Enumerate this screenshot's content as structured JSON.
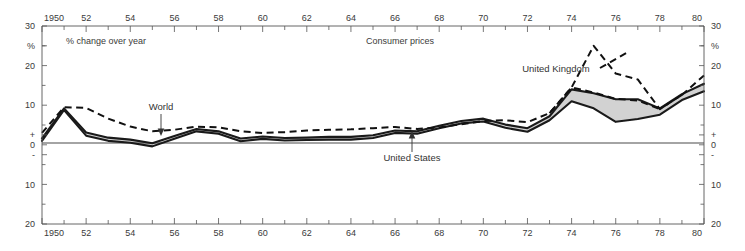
{
  "chart_data": {
    "type": "line",
    "title": "Consumer prices",
    "subtitle": "% change over year",
    "xlabel": "",
    "ylabel": "%",
    "xlim": [
      1950,
      1980
    ],
    "ylim": [
      -20,
      30
    ],
    "grid": false,
    "legend_position": "inline-annotations",
    "x_tick_labels": [
      "1950",
      "52",
      "54",
      "56",
      "58",
      "60",
      "62",
      "64",
      "66",
      "68",
      "70",
      "72",
      "74",
      "76",
      "78",
      "80"
    ],
    "x_tick_values": [
      1950,
      1952,
      1954,
      1956,
      1958,
      1960,
      1962,
      1964,
      1966,
      1968,
      1970,
      1972,
      1974,
      1976,
      1978,
      1980
    ],
    "x_minor_tick_values": [
      1951,
      1953,
      1955,
      1957,
      1959,
      1961,
      1963,
      1965,
      1967,
      1969,
      1971,
      1973,
      1975,
      1977,
      1979
    ],
    "y_tick_labels_left": [
      "30",
      "%",
      "20",
      "10",
      "+",
      "0",
      "-",
      "10",
      "20"
    ],
    "y_tick_labels_right": [
      "30",
      "%",
      "20",
      "10",
      "+",
      "0",
      "-",
      "10",
      "20"
    ],
    "y_tick_values": [
      30,
      25,
      20,
      10,
      2.5,
      0,
      -2.5,
      -10,
      -20
    ],
    "x": [
      1950,
      1951,
      1952,
      1953,
      1954,
      1955,
      1956,
      1957,
      1958,
      1959,
      1960,
      1961,
      1962,
      1963,
      1964,
      1965,
      1966,
      1967,
      1968,
      1969,
      1970,
      1971,
      1972,
      1973,
      1974,
      1975,
      1976,
      1977,
      1978,
      1979,
      1980
    ],
    "series": [
      {
        "name": "World",
        "style": "dashed",
        "annotation": "World",
        "annotation_x": 1954.2,
        "annotation_y": 9.6,
        "values": [
          3.0,
          9.5,
          9.3,
          6.6,
          4.6,
          3.4,
          3.8,
          4.6,
          4.4,
          3.4,
          3.0,
          3.2,
          3.6,
          3.8,
          3.9,
          4.2,
          4.5,
          4.0,
          4.4,
          5.2,
          6.0,
          6.2,
          5.7,
          8.0,
          14.5,
          13.2,
          11.6,
          11.2,
          9.0,
          12.6,
          17.5
        ]
      },
      {
        "name": "United Kingdom",
        "style": "dashed",
        "annotation": "United Kingdom",
        "annotation_x": 1971.4,
        "annotation_y": 20.0,
        "values": [
          3.0,
          9.5,
          9.3,
          6.6,
          4.6,
          3.4,
          3.8,
          4.6,
          4.4,
          3.4,
          3.0,
          3.2,
          3.6,
          3.8,
          3.9,
          4.2,
          4.5,
          4.0,
          4.4,
          5.2,
          6.0,
          6.2,
          5.7,
          8.0,
          14.5,
          25.0,
          18.0,
          16.5,
          9.0,
          12.6,
          17.5
        ]
      },
      {
        "name": "United States",
        "style": "solid",
        "annotation": "United States",
        "annotation_x": 1965.6,
        "annotation_y": -5.6,
        "values": [
          1.0,
          8.8,
          2.3,
          1.0,
          0.5,
          -0.4,
          1.5,
          3.4,
          2.8,
          0.9,
          1.5,
          1.1,
          1.2,
          1.3,
          1.3,
          1.7,
          3.0,
          2.8,
          4.2,
          5.4,
          5.9,
          4.3,
          3.3,
          6.2,
          11.0,
          9.2,
          5.8,
          6.5,
          7.6,
          11.3,
          13.5
        ]
      },
      {
        "name": "band-upper",
        "style": "solid",
        "values": [
          1.6,
          9.2,
          3.1,
          1.8,
          1.3,
          0.4,
          2.2,
          4.0,
          3.4,
          1.6,
          2.1,
          1.7,
          1.8,
          2.0,
          2.0,
          2.4,
          3.6,
          3.4,
          4.8,
          6.0,
          6.6,
          5.1,
          4.2,
          7.2,
          14.0,
          13.0,
          11.5,
          11.5,
          9.2,
          12.8,
          15.4
        ]
      }
    ]
  },
  "annotations": {
    "subtitle": "% change over year",
    "title": "Consumer prices",
    "world": "World",
    "united_kingdom": "United Kingdom",
    "united_states": "United States"
  },
  "colors": {
    "band": "#d2d2d2",
    "line": "#111111",
    "axis": "#555555",
    "text": "#333333"
  }
}
